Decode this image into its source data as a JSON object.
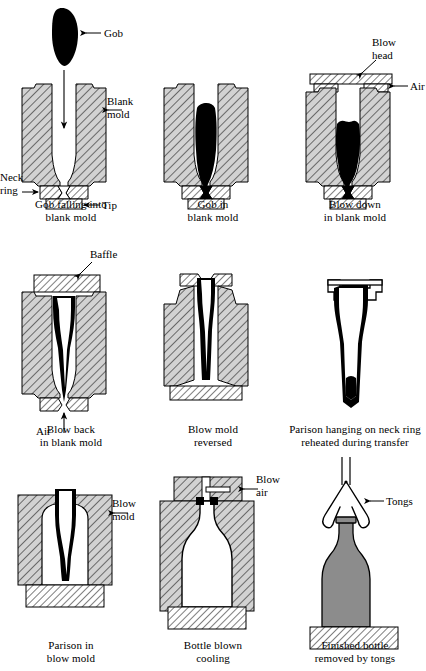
{
  "figure": {
    "colors": {
      "mold_fill": "#d0d0d0",
      "hatch_line": "#000000",
      "glass_molten": "#000000",
      "glass_finished": "#8c8c8c",
      "outline": "#000000",
      "background": "#ffffff"
    }
  },
  "panels": [
    {
      "id": "gob-falling",
      "caption_line1": "Gob falling into",
      "caption_line2": "blank mold",
      "labels": [
        {
          "name": "gob",
          "text": "Gob"
        },
        {
          "name": "blank-mold",
          "text_line1": "Blank",
          "text_line2": "mold"
        },
        {
          "name": "neck-ring",
          "text_line1": "Neck",
          "text_line2": "ring"
        },
        {
          "name": "tip",
          "text": "Tip"
        }
      ]
    },
    {
      "id": "gob-in-blank-mold",
      "caption_line1": "Gob in",
      "caption_line2": "blank mold",
      "labels": []
    },
    {
      "id": "blow-down",
      "caption_line1": "Blow down",
      "caption_line2": "in blank mold",
      "labels": [
        {
          "name": "blow-head",
          "text_line1": "Blow",
          "text_line2": "head"
        },
        {
          "name": "air",
          "text": "Air"
        }
      ]
    },
    {
      "id": "blow-back",
      "caption_line1": "Blow back",
      "caption_line2": "in blank mold",
      "labels": [
        {
          "name": "baffle",
          "text": "Baffle"
        },
        {
          "name": "air",
          "text": "Air"
        }
      ]
    },
    {
      "id": "blow-mold-reversed",
      "caption_line1": "Blow mold",
      "caption_line2": "reversed",
      "labels": []
    },
    {
      "id": "parison-hanging",
      "caption_line1": "Parison hanging on neck ring",
      "caption_line2": "reheated during transfer",
      "labels": []
    },
    {
      "id": "parison-in-blow-mold",
      "caption_line1": "Parison in",
      "caption_line2": "blow mold",
      "labels": [
        {
          "name": "blow-mold",
          "text_line1": "Blow",
          "text_line2": "mold"
        }
      ]
    },
    {
      "id": "bottle-blown-cooling",
      "caption_line1": "Bottle blown",
      "caption_line2": "cooling",
      "labels": [
        {
          "name": "blow-air",
          "text_line1": "Blow",
          "text_line2": "air"
        }
      ]
    },
    {
      "id": "finished-bottle",
      "caption_line1": "Finished bottle",
      "caption_line2": "removed by tongs",
      "labels": [
        {
          "name": "tongs",
          "text": "Tongs"
        }
      ]
    }
  ]
}
